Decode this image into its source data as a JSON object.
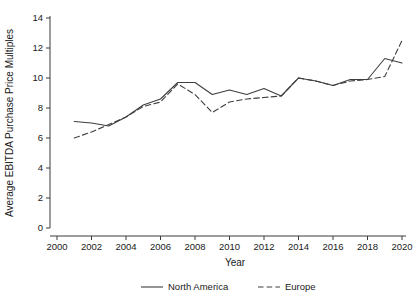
{
  "chart_data": {
    "type": "line",
    "title": "",
    "xlabel": "Year",
    "ylabel": "Average EBITDA Purchase Price Multiples",
    "xlim": [
      2000,
      2020
    ],
    "ylim": [
      0,
      14
    ],
    "xticks": [
      2000,
      2002,
      2004,
      2006,
      2008,
      2010,
      2012,
      2014,
      2016,
      2018,
      2020
    ],
    "yticks": [
      0,
      2,
      4,
      6,
      8,
      10,
      12,
      14
    ],
    "grid": false,
    "legend_position": "bottom",
    "x": [
      2001,
      2002,
      2003,
      2004,
      2005,
      2006,
      2007,
      2008,
      2009,
      2010,
      2011,
      2012,
      2013,
      2014,
      2015,
      2016,
      2017,
      2018,
      2019,
      2020
    ],
    "series": [
      {
        "name": "North America",
        "style": "solid",
        "color": "#3f3f3f",
        "values": [
          7.1,
          7.0,
          6.8,
          7.4,
          8.2,
          8.6,
          9.7,
          9.7,
          8.9,
          9.2,
          8.9,
          9.3,
          8.8,
          10.0,
          9.8,
          9.5,
          9.9,
          9.9,
          11.3,
          11.0
        ]
      },
      {
        "name": "Europe",
        "style": "dashed",
        "color": "#3f3f3f",
        "values": [
          6.0,
          6.4,
          6.9,
          7.4,
          8.1,
          8.4,
          9.6,
          8.9,
          7.7,
          8.4,
          8.6,
          8.7,
          8.8,
          10.0,
          9.8,
          9.5,
          9.8,
          9.9,
          10.1,
          12.5
        ]
      }
    ]
  },
  "legend": {
    "items": [
      {
        "label": "North America",
        "style": "solid"
      },
      {
        "label": "Europe",
        "style": "dashed"
      }
    ]
  }
}
